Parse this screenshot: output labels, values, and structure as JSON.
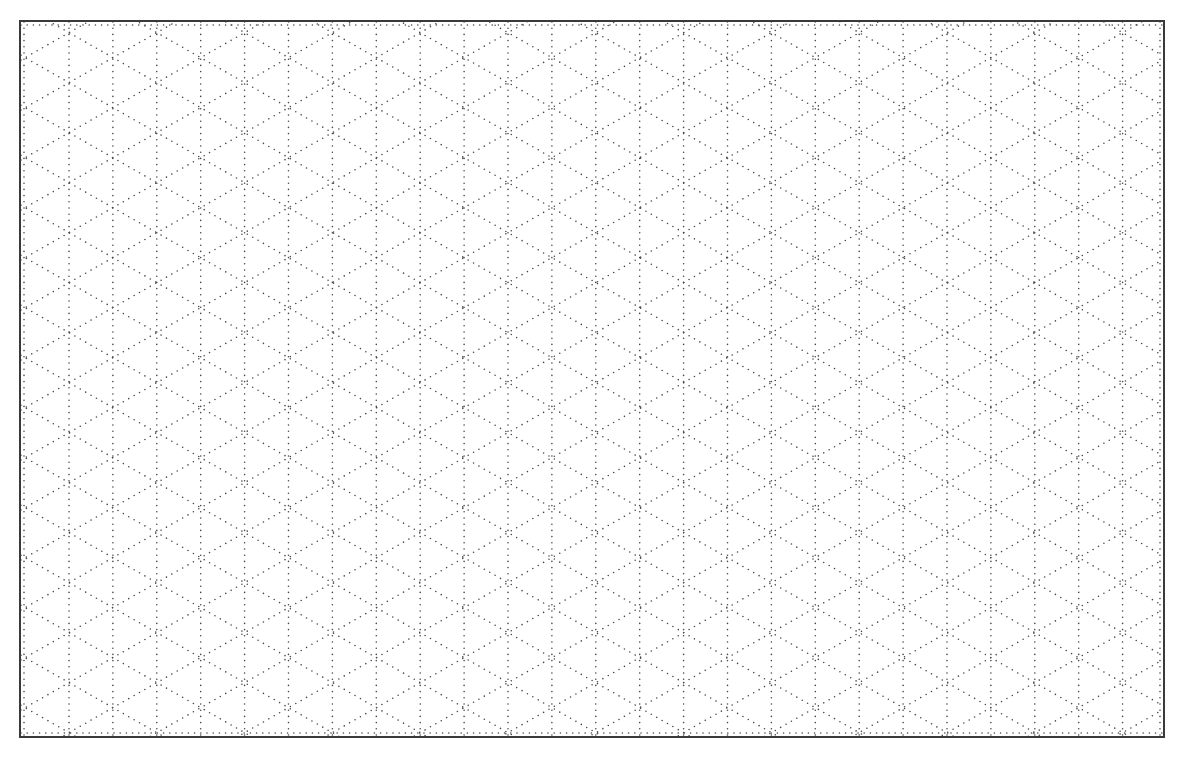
{
  "sheet": {
    "left": 19,
    "top": 20,
    "width": 1146,
    "height": 718,
    "border_color": "#3a3a3a"
  },
  "grid": {
    "type": "isometric-dotted",
    "column_spacing": 43.9,
    "row_period": 50,
    "first_column_x": 48,
    "dot_color": "#4a4a4a",
    "dot_size": 1.6,
    "dot_gap": 6.2
  }
}
